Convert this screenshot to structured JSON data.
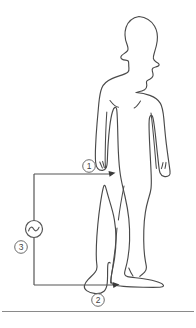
{
  "figure": {
    "type": "technical-line-diagram",
    "background_color": "#ffffff",
    "line_color": "#4a4a4a",
    "wire_color": "#555555",
    "callout_color": "#6b6b6b",
    "baseline_color": "#8a8a8a"
  },
  "callouts": [
    {
      "id": "1",
      "label": "1",
      "display": "①",
      "target": "left-hand",
      "cx": 89,
      "cy": 166
    },
    {
      "id": "2",
      "label": "2",
      "display": "②",
      "target": "left-foot",
      "cx": 98,
      "cy": 300
    },
    {
      "id": "3",
      "label": "3",
      "display": "③",
      "target": "ac-source",
      "cx": 21,
      "cy": 247
    }
  ],
  "source": {
    "name": "ac-voltage-source",
    "symbol": "~",
    "cx": 34,
    "cy": 229,
    "r": 8.5
  },
  "circuit": {
    "top_wire": {
      "x1": 34,
      "y1": 174,
      "x2": 113,
      "y2": 174
    },
    "bottom_wire": {
      "x1": 34,
      "y1": 285,
      "x2": 117,
      "y2": 285
    },
    "left_wire_upper": {
      "x1": 34,
      "y1": 174,
      "x2": 34,
      "y2": 220
    },
    "left_wire_lower": {
      "x1": 34,
      "y1": 238,
      "x2": 34,
      "y2": 285
    }
  },
  "baseline": {
    "y": 311,
    "x1": 2,
    "x2": 194
  },
  "human_figure": {
    "name": "human-body-silhouette",
    "pose": "standing, head in right profile, arms at sides",
    "facing": "right"
  }
}
